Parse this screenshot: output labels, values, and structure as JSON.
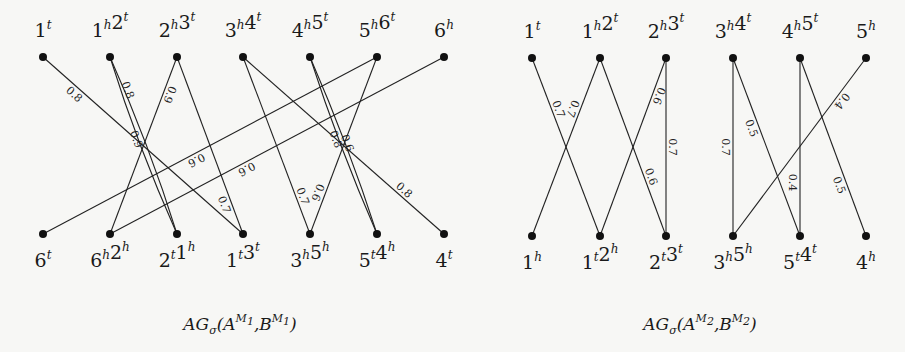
{
  "graphs": [
    {
      "id": "graph-1",
      "caption": {
        "base": "AG",
        "sub": "σ",
        "args": "(A",
        "sup1": "M",
        "sup1sub": "1",
        "mid": ",B",
        "sup2": "M",
        "sup2sub": "1",
        "end": ")"
      },
      "caption_text": "AGσ(A^M1,B^M1)",
      "caption_x": 240,
      "top_y": 57,
      "bottom_y": 234,
      "top_nodes": [
        {
          "x": 43,
          "parts": [
            [
              "1",
              "t"
            ]
          ]
        },
        {
          "x": 110,
          "parts": [
            [
              "1",
              "h"
            ],
            [
              "2",
              "t"
            ]
          ]
        },
        {
          "x": 177,
          "parts": [
            [
              "2",
              "h"
            ],
            [
              "3",
              "t"
            ]
          ]
        },
        {
          "x": 243,
          "parts": [
            [
              "3",
              "h"
            ],
            [
              "4",
              "t"
            ]
          ]
        },
        {
          "x": 310,
          "parts": [
            [
              "4",
              "h"
            ],
            [
              "5",
              "t"
            ]
          ]
        },
        {
          "x": 377,
          "parts": [
            [
              "5",
              "h"
            ],
            [
              "6",
              "t"
            ]
          ]
        },
        {
          "x": 444,
          "parts": [
            [
              "6",
              "h"
            ]
          ]
        }
      ],
      "bottom_nodes": [
        {
          "x": 43,
          "parts": [
            [
              "6",
              "t"
            ]
          ]
        },
        {
          "x": 110,
          "parts": [
            [
              "6",
              "h"
            ],
            [
              "2",
              "h"
            ]
          ]
        },
        {
          "x": 177,
          "parts": [
            [
              "2",
              "t"
            ],
            [
              "1",
              "h"
            ]
          ]
        },
        {
          "x": 243,
          "parts": [
            [
              "1",
              "t"
            ],
            [
              "3",
              "t"
            ]
          ]
        },
        {
          "x": 310,
          "parts": [
            [
              "3",
              "h"
            ],
            [
              "5",
              "h"
            ]
          ]
        },
        {
          "x": 377,
          "parts": [
            [
              "5",
              "t"
            ],
            [
              "4",
              "h"
            ]
          ]
        },
        {
          "x": 444,
          "parts": [
            [
              "4",
              "t"
            ]
          ]
        }
      ],
      "edges": [
        {
          "from": 0,
          "to": 3,
          "w": "0.8",
          "t": 0.18,
          "side": 1
        },
        {
          "from": 1,
          "to": 2,
          "w": "0.8",
          "t": 0.2,
          "side": -1,
          "bend": -6
        },
        {
          "from": 1,
          "to": 2,
          "w": "0.9",
          "t": 0.45,
          "side": 1,
          "bend": 6
        },
        {
          "from": 2,
          "to": 1,
          "w": "0.9",
          "t": 0.2,
          "side": -1
        },
        {
          "from": 2,
          "to": 3,
          "w": "0.7",
          "t": 0.82,
          "side": 1
        },
        {
          "from": 3,
          "to": 4,
          "w": "0.7",
          "t": 0.8,
          "side": -1
        },
        {
          "from": 3,
          "to": 6,
          "w": "0.8",
          "t": 0.78,
          "side": -1
        },
        {
          "from": 4,
          "to": 5,
          "w": "0.6",
          "t": 0.5,
          "side": -1,
          "bend": -5
        },
        {
          "from": 4,
          "to": 5,
          "w": "0.8",
          "t": 0.45,
          "side": 1,
          "bend": 5
        },
        {
          "from": 5,
          "to": 4,
          "w": "0.6",
          "t": 0.78,
          "side": 1
        },
        {
          "from": 5,
          "to": 0,
          "w": "0.6",
          "t": 0.55,
          "side": -1
        },
        {
          "from": 6,
          "to": 1,
          "w": "0.6",
          "t": 0.6,
          "side": -1
        }
      ]
    },
    {
      "id": "graph-2",
      "caption": {
        "base": "AG",
        "sub": "σ",
        "args": "(A",
        "sup1": "M",
        "sup1sub": "2",
        "mid": ",B",
        "sup2": "M",
        "sup2sub": "2",
        "end": ")"
      },
      "caption_text": "AGσ(A^M2,B^M2)",
      "caption_x": 700,
      "top_y": 58,
      "bottom_y": 236,
      "top_nodes": [
        {
          "x": 532,
          "parts": [
            [
              "1",
              "t"
            ]
          ]
        },
        {
          "x": 600,
          "parts": [
            [
              "1",
              "h"
            ],
            [
              "2",
              "t"
            ]
          ]
        },
        {
          "x": 666,
          "parts": [
            [
              "2",
              "h"
            ],
            [
              "3",
              "t"
            ]
          ]
        },
        {
          "x": 733,
          "parts": [
            [
              "3",
              "h"
            ],
            [
              "4",
              "t"
            ]
          ]
        },
        {
          "x": 800,
          "parts": [
            [
              "4",
              "h"
            ],
            [
              "5",
              "t"
            ]
          ]
        },
        {
          "x": 866,
          "parts": [
            [
              "5",
              "h"
            ]
          ]
        }
      ],
      "bottom_nodes": [
        {
          "x": 532,
          "parts": [
            [
              "1",
              "h"
            ]
          ]
        },
        {
          "x": 600,
          "parts": [
            [
              "1",
              "t"
            ],
            [
              "2",
              "h"
            ]
          ]
        },
        {
          "x": 666,
          "parts": [
            [
              "2",
              "t"
            ],
            [
              "3",
              "t"
            ]
          ]
        },
        {
          "x": 733,
          "parts": [
            [
              "3",
              "h"
            ],
            [
              "5",
              "h"
            ]
          ]
        },
        {
          "x": 800,
          "parts": [
            [
              "5",
              "t"
            ],
            [
              "4",
              "t"
            ]
          ]
        },
        {
          "x": 866,
          "parts": [
            [
              "4",
              "h"
            ]
          ]
        }
      ],
      "edges": [
        {
          "from": 0,
          "to": 1,
          "w": "0.7",
          "t": 0.3,
          "side": -1
        },
        {
          "from": 1,
          "to": 0,
          "w": "0.7",
          "t": 0.3,
          "side": 1
        },
        {
          "from": 1,
          "to": 2,
          "w": "0.6",
          "t": 0.68,
          "side": -1
        },
        {
          "from": 2,
          "to": 1,
          "w": "0.6",
          "t": 0.2,
          "side": -1
        },
        {
          "from": 2,
          "to": 2,
          "w": "0.7",
          "t": 0.5,
          "side": -1
        },
        {
          "from": 3,
          "to": 3,
          "w": "0.7",
          "t": 0.5,
          "side": 1
        },
        {
          "from": 3,
          "to": 4,
          "w": "0.5",
          "t": 0.38,
          "side": 1
        },
        {
          "from": 4,
          "to": 4,
          "w": "0.4",
          "t": 0.7,
          "side": 1
        },
        {
          "from": 4,
          "to": 5,
          "w": "0.5",
          "t": 0.7,
          "side": 1
        },
        {
          "from": 5,
          "to": 3,
          "w": "0.4",
          "t": 0.22,
          "side": -1
        }
      ]
    }
  ]
}
